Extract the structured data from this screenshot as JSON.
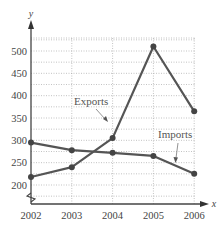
{
  "chart_data": {
    "type": "line",
    "title": "",
    "xlabel": "x",
    "ylabel": "y",
    "categories": [
      "2002",
      "2003",
      "2004",
      "2005",
      "2006"
    ],
    "x": [
      2002,
      2003,
      2004,
      2005,
      2006
    ],
    "series": [
      {
        "name": "Exports",
        "values": [
          218,
          240,
          305,
          510,
          365
        ]
      },
      {
        "name": "Imports",
        "values": [
          295,
          278,
          272,
          265,
          225
        ]
      }
    ],
    "yticks": [
      200,
      250,
      300,
      350,
      400,
      450,
      500
    ],
    "ylim": [
      160,
      530
    ],
    "y_axis_break": true,
    "grid": true,
    "grid_style": "dotted",
    "annotations": [
      {
        "text": "Exports",
        "points_to": "Exports line"
      },
      {
        "text": "Imports",
        "points_to": "Imports line"
      }
    ],
    "line_color": "#555555"
  },
  "labels": {
    "y_axis": "y",
    "x_axis": "x",
    "exports": "Exports",
    "imports": "Imports"
  }
}
